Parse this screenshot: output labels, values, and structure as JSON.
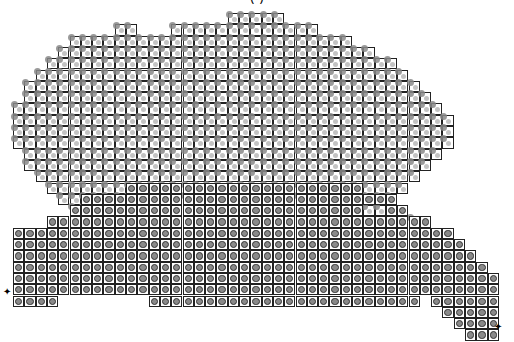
{
  "title": "( )",
  "cell_size": 11.3,
  "origin": {
    "x": 13,
    "y": 13
  },
  "colors": {
    "grid_line": "#222222",
    "circle_fill": "#8a8a8a",
    "pattern_gray": "#888888",
    "background": "#ffffff"
  },
  "markers": [
    {
      "name": "start-marker",
      "glyph": "✦",
      "x": 3,
      "y": 287
    },
    {
      "name": "end-marker",
      "glyph": "✦",
      "x": 494,
      "y": 322
    }
  ],
  "white_rows": [
    [
      0,
      19,
      23
    ],
    [
      1,
      9,
      10
    ],
    [
      1,
      14,
      26
    ],
    [
      2,
      5,
      29
    ],
    [
      3,
      4,
      31
    ],
    [
      4,
      3,
      33
    ],
    [
      5,
      2,
      34
    ],
    [
      6,
      1,
      35
    ],
    [
      7,
      1,
      36
    ],
    [
      8,
      0,
      37
    ],
    [
      9,
      0,
      38
    ],
    [
      10,
      0,
      38
    ],
    [
      11,
      0,
      38
    ],
    [
      12,
      1,
      37
    ],
    [
      13,
      1,
      36
    ],
    [
      14,
      2,
      35
    ],
    [
      15,
      3,
      34
    ],
    [
      16,
      4,
      33
    ],
    [
      17,
      5,
      9
    ],
    [
      17,
      31,
      32
    ],
    [
      18,
      34,
      35
    ]
  ],
  "gray_rows": [
    [
      15,
      10,
      30
    ],
    [
      16,
      6,
      33
    ],
    [
      17,
      5,
      30
    ],
    [
      17,
      33,
      34
    ],
    [
      18,
      3,
      36
    ],
    [
      19,
      0,
      38
    ],
    [
      20,
      0,
      39
    ],
    [
      21,
      0,
      40
    ],
    [
      22,
      0,
      41
    ],
    [
      23,
      0,
      42
    ],
    [
      24,
      0,
      42
    ],
    [
      25,
      0,
      3
    ],
    [
      25,
      12,
      35
    ],
    [
      25,
      37,
      42
    ],
    [
      26,
      38,
      42
    ],
    [
      27,
      39,
      42
    ],
    [
      28,
      40,
      42
    ]
  ]
}
